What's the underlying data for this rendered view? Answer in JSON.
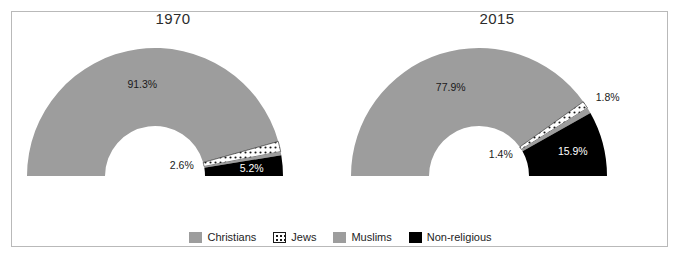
{
  "figure": {
    "background": "#ffffff",
    "frame_color": "#b9b9b9"
  },
  "colors": {
    "christians": "#9d9d9d",
    "jews_fill": "#ffffff",
    "jews_dots": "#1a1a1a",
    "muslims": "#9d9d9d",
    "nonreligious": "#000000",
    "label_dark": "#1a1a1a",
    "label_light": "#ffffff"
  },
  "legend": {
    "position": "bottom-center",
    "items": [
      {
        "label": "Christians",
        "key": "christians",
        "swatch": "solid",
        "color": "#9d9d9d"
      },
      {
        "label": "Jews",
        "key": "jews",
        "swatch": "dotted",
        "color": "#ffffff"
      },
      {
        "label": "Muslims",
        "key": "muslims",
        "swatch": "solid",
        "color": "#9d9d9d"
      },
      {
        "label": "Non-religious",
        "key": "nonreligious",
        "swatch": "solid",
        "color": "#000000"
      }
    ]
  },
  "chart_data": {
    "type": "pie",
    "variant": "half-donut",
    "title": "",
    "xlabel": "",
    "ylabel": "",
    "legend_position": "bottom",
    "grid": false,
    "categories": [
      "Christians",
      "Jews",
      "Muslims",
      "Non-religious"
    ],
    "panels": [
      {
        "title": "1970",
        "values": [
          91.3,
          2.6,
          0.9,
          5.2
        ],
        "labels": [
          "91.3%",
          "2.6%",
          "",
          "5.2%"
        ],
        "shown_labels": [
          "91.3%",
          "2.6%",
          "5.2%"
        ]
      },
      {
        "title": "2015",
        "values": [
          77.9,
          1.8,
          1.4,
          15.9
        ],
        "labels": [
          "77.9%",
          "1.8%",
          "1.4%",
          "15.9%"
        ],
        "shown_labels": [
          "77.9%",
          "1.8%",
          "1.4%",
          "15.9%"
        ]
      }
    ]
  },
  "panels": {
    "p1970": {
      "title": "1970",
      "slices": {
        "christians": "91.3%",
        "jews": "2.6%",
        "muslims": "",
        "nonreligious": "5.2%"
      }
    },
    "p2015": {
      "title": "2015",
      "slices": {
        "christians": "77.9%",
        "jews": "1.8%",
        "muslims": "1.4%",
        "nonreligious": "15.9%"
      }
    }
  }
}
